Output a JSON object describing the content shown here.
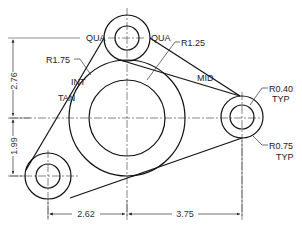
{
  "drawing": {
    "type": "mechanical link drafting drawing",
    "stroke_color": "#111111",
    "thin_color": "#444444",
    "background": "#ffffff"
  },
  "labels": {
    "qua_left": "QUA",
    "qua_right": "QUA",
    "r175": "R1.75",
    "r125": "R1.25",
    "int": "INT",
    "tan": "TAN",
    "mid": "MID",
    "r040": "R0.40",
    "r040_typ": "TYP",
    "r075": "R0.75",
    "r075_typ": "TYP"
  },
  "dimensions": {
    "vertical_upper": "2.76",
    "vertical_lower": "1.99",
    "horizontal_left": "2.62",
    "horizontal_right": "3.75"
  },
  "circles": {
    "top": {
      "cx": 127,
      "cy": 38,
      "outer_r": 23,
      "inner_r": 12
    },
    "center": {
      "cx": 127,
      "cy": 118,
      "outer_r": 58,
      "inner_r": 38
    },
    "right": {
      "cx": 242,
      "cy": 117,
      "outer_r": 21,
      "inner_r": 12
    },
    "bottom_left": {
      "cx": 48,
      "cy": 176,
      "outer_r": 23,
      "inner_r": 12
    }
  }
}
